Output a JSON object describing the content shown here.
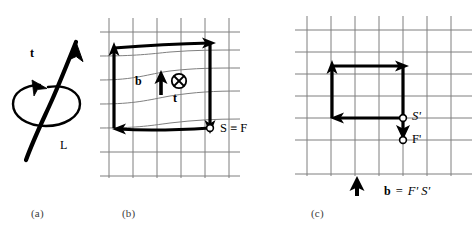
{
  "figure": {
    "background": "#ffffff",
    "ink": "#000000",
    "grid_color": "#808080",
    "caption_color": "#3d3d3d"
  },
  "panels": [
    {
      "id": "a",
      "caption": "(a)",
      "description": "Dislocation line L with tangent vector t and a right-handed circulation loop",
      "labels": [
        {
          "name": "tangent-vector-label",
          "text": "t",
          "style": "bold"
        },
        {
          "name": "dislocation-line-label",
          "text": "L",
          "style": "regular"
        }
      ]
    },
    {
      "id": "b",
      "caption": "(b)",
      "description": "Burgers circuit in the distorted crystal; circuit closes at the start/finish point",
      "labels": [
        {
          "name": "burgers-vector-label",
          "text": "b",
          "style": "bold"
        },
        {
          "name": "tangent-vector-label",
          "text": "t",
          "style": "bold"
        },
        {
          "name": "start-finish-label",
          "text": "S ≡ F",
          "style": "regular"
        }
      ],
      "grid": {
        "type": "distorted",
        "cols": 6,
        "rows": 6
      }
    },
    {
      "id": "c",
      "caption": "(c)",
      "description": "Same circuit mapped into the perfect reference crystal; closure failure F'S' equals the Burgers vector",
      "labels": [
        {
          "name": "start-label",
          "text": "S'",
          "style": "italic"
        },
        {
          "name": "finish-label",
          "text": "F'",
          "style": "italic"
        },
        {
          "name": "burgers-vector-equation",
          "text_bold": "b",
          "text_rest": "=  F′ S′",
          "style": "mixed"
        }
      ],
      "grid": {
        "type": "perfect",
        "cols": 7,
        "rows": 7
      }
    }
  ],
  "annotations": {
    "b_symbol": "b",
    "t_symbol": "t",
    "L_symbol": "L",
    "S_equiv_F": "S ≡ F",
    "S_prime": "S'",
    "F_prime": "F'",
    "equals": "=",
    "FS_prime": "F′ S′",
    "cap_a": "(a)",
    "cap_b": "(b)",
    "cap_c": "(c)"
  }
}
